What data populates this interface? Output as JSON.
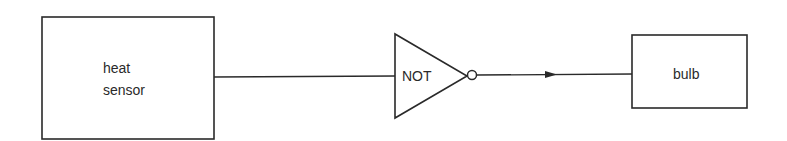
{
  "diagram": {
    "title": "",
    "nodes": [
      {
        "id": "heat_sensor",
        "type": "box",
        "label_lines": [
          "heat",
          "sensor"
        ]
      },
      {
        "id": "not_gate",
        "type": "not-gate",
        "label": "NOT"
      },
      {
        "id": "bulb",
        "type": "box",
        "label": "bulb"
      }
    ],
    "edges": [
      {
        "from": "heat_sensor",
        "to": "not_gate",
        "arrow": false
      },
      {
        "from": "not_gate",
        "to": "bulb",
        "arrow": true
      }
    ],
    "colors": {
      "stroke": "#2a2a2a",
      "background": "#ffffff"
    }
  }
}
